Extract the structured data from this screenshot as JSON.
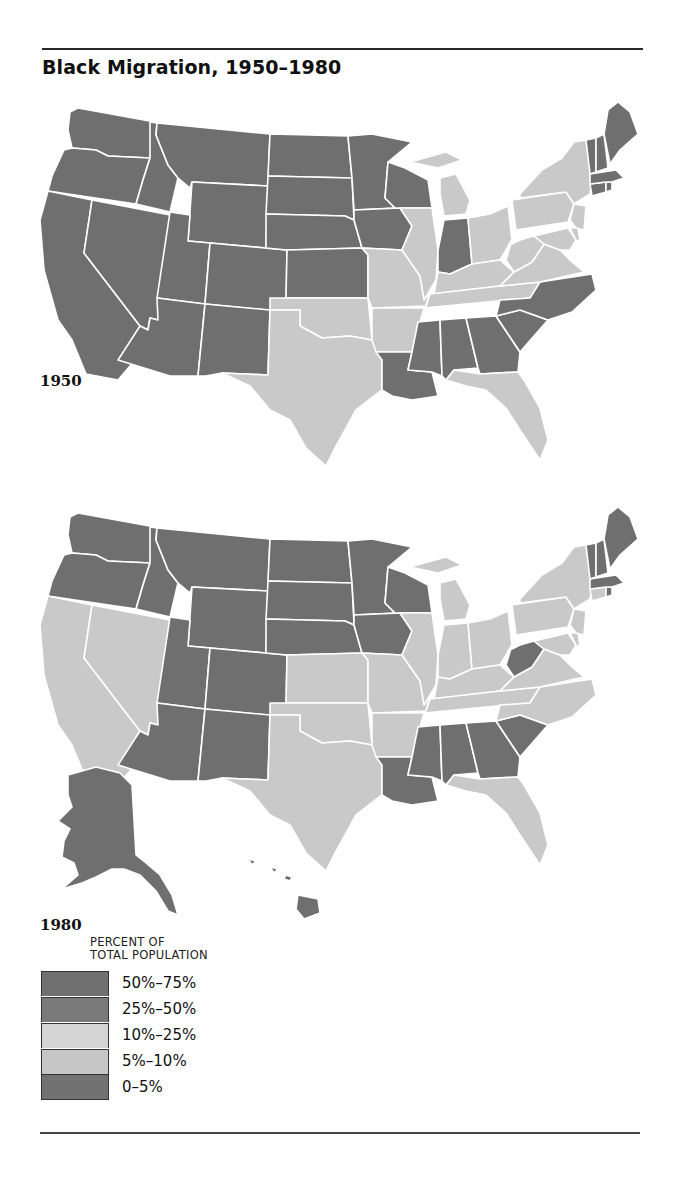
{
  "title": "Black Migration, 1950–1980",
  "colors": {
    "dark": "#6f6f6f",
    "light": "#c9c9c9",
    "border": "#ffffff"
  },
  "legend": {
    "title_line1": "PERCENT OF",
    "title_line2": "TOTAL POPULATION",
    "items": [
      {
        "label": "50%–75%",
        "color": "#707070"
      },
      {
        "label": "25%–50%",
        "color": "#7a7a7a"
      },
      {
        "label": "10%–25%",
        "color": "#d4d4d4"
      },
      {
        "label": "5%–10%",
        "color": "#c6c6c6"
      },
      {
        "label": "0–5%",
        "color": "#727272"
      }
    ]
  },
  "maps": [
    {
      "year": "1950",
      "dark_states": [
        "WA",
        "OR",
        "CA",
        "ID",
        "NV",
        "MT",
        "WY",
        "UT",
        "AZ",
        "CO",
        "NM",
        "ND",
        "SD",
        "NE",
        "KS",
        "MN",
        "IA",
        "WI",
        "IN",
        "ME",
        "NH",
        "VT",
        "MA",
        "CT",
        "RI",
        "NC",
        "SC",
        "GA",
        "AL",
        "MS",
        "LA"
      ],
      "light_states": [
        "TX",
        "OK",
        "MO",
        "AR",
        "IL",
        "MI",
        "OH",
        "KY",
        "TN",
        "WV",
        "VA",
        "MD",
        "DE",
        "NJ",
        "PA",
        "NY",
        "FL"
      ]
    },
    {
      "year": "1980",
      "dark_states": [
        "WA",
        "OR",
        "ID",
        "MT",
        "WY",
        "UT",
        "AZ",
        "CO",
        "NM",
        "ND",
        "SD",
        "NE",
        "MN",
        "IA",
        "WI",
        "WV",
        "ME",
        "NH",
        "VT",
        "MA",
        "RI",
        "SC",
        "GA",
        "AL",
        "MS",
        "LA",
        "AK",
        "HI"
      ],
      "light_states": [
        "CA",
        "NV",
        "KS",
        "TX",
        "OK",
        "MO",
        "AR",
        "IL",
        "IN",
        "MI",
        "OH",
        "KY",
        "TN",
        "VA",
        "NC",
        "MD",
        "DE",
        "NJ",
        "PA",
        "NY",
        "CT",
        "FL"
      ]
    }
  ],
  "chart_data": {
    "type": "choropleth",
    "title": "Black Migration, 1950–1980",
    "legend_title": "PERCENT OF TOTAL POPULATION",
    "legend_categories": [
      "50%–75%",
      "25%–50%",
      "10%–25%",
      "5%–10%",
      "0–5%"
    ],
    "panels": [
      {
        "label": "1950",
        "shading": {
          "dark": [
            "WA",
            "OR",
            "CA",
            "ID",
            "NV",
            "MT",
            "WY",
            "UT",
            "AZ",
            "CO",
            "NM",
            "ND",
            "SD",
            "NE",
            "KS",
            "MN",
            "IA",
            "WI",
            "IN",
            "ME",
            "NH",
            "VT",
            "MA",
            "CT",
            "RI",
            "NC",
            "SC",
            "GA",
            "AL",
            "MS",
            "LA"
          ],
          "light": [
            "TX",
            "OK",
            "MO",
            "AR",
            "IL",
            "MI",
            "OH",
            "KY",
            "TN",
            "WV",
            "VA",
            "MD",
            "DE",
            "NJ",
            "PA",
            "NY",
            "FL"
          ]
        }
      },
      {
        "label": "1980",
        "shading": {
          "dark": [
            "WA",
            "OR",
            "ID",
            "MT",
            "WY",
            "UT",
            "AZ",
            "CO",
            "NM",
            "ND",
            "SD",
            "NE",
            "MN",
            "IA",
            "WI",
            "WV",
            "ME",
            "NH",
            "VT",
            "MA",
            "RI",
            "SC",
            "GA",
            "AL",
            "MS",
            "LA",
            "AK",
            "HI"
          ],
          "light": [
            "CA",
            "NV",
            "KS",
            "TX",
            "OK",
            "MO",
            "AR",
            "IL",
            "IN",
            "MI",
            "OH",
            "KY",
            "TN",
            "VA",
            "NC",
            "MD",
            "DE",
            "NJ",
            "PA",
            "NY",
            "CT",
            "FL"
          ]
        }
      }
    ]
  }
}
